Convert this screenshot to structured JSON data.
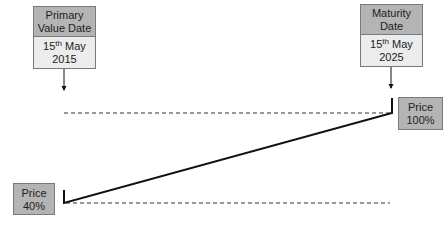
{
  "primary_value_date": {
    "label": "Primary Value Date",
    "label_line1": "Primary",
    "label_line2": "Value Date",
    "day": "15",
    "day_suffix": "th",
    "month": "May",
    "year": "2015"
  },
  "maturity_date": {
    "label": "Maturity Date",
    "label_line1": "Maturity",
    "label_line2": "Date",
    "day": "15",
    "day_suffix": "th",
    "month": "May",
    "year": "2025"
  },
  "price_end": {
    "label": "Price",
    "value": "100%"
  },
  "price_start": {
    "label": "Price",
    "value": "40%"
  },
  "colors": {
    "box_header": "#b4b4b4",
    "box_body": "#ececec",
    "border": "#7a7a7a",
    "line": "#111111"
  }
}
